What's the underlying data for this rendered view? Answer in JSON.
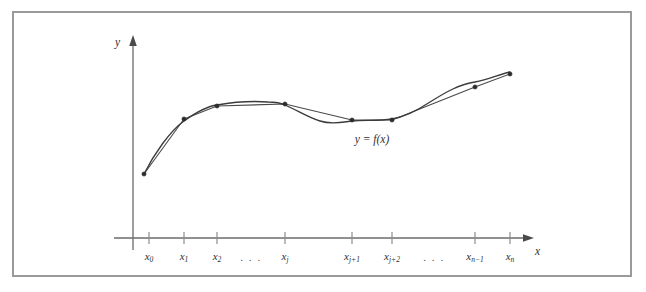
{
  "figure": {
    "frame_border_color": "#9a9a9a",
    "background_color": "#ffffff",
    "curve_color": "#3b3b3b",
    "chord_color": "#4a4a4a",
    "axis_color": "#6b6b6b",
    "point_color": "#2b2b2b"
  },
  "labels": {
    "y_axis": "y",
    "x_axis": "x",
    "curve_equation_y": "y",
    "curve_equation_eq": "=",
    "curve_equation_f": "f",
    "curve_equation_paren_open": "(",
    "curve_equation_var": "x",
    "curve_equation_paren_close": ")",
    "curve_equation_full": "y = f(x)",
    "ellipsis": ". . ."
  },
  "chart_data": {
    "type": "line",
    "title": "",
    "subtitle": "",
    "xlabel": "x",
    "ylabel": "y",
    "grid": false,
    "legend": null,
    "annotations": [
      {
        "text": "y = f(x)",
        "x_px": 370,
        "y_px": 128
      }
    ],
    "axis": {
      "y_axis_x_px": 131,
      "y_axis_top_px": 36,
      "y_axis_bottom_px": 248,
      "x_axis_y_px": 236,
      "x_axis_left_px": 112,
      "x_axis_right_px": 530,
      "arrow_x_px": 528,
      "arrow_y_px": 38
    },
    "tick_labels": [
      {
        "base": "x",
        "sub": "0",
        "x_px": 147
      },
      {
        "base": "x",
        "sub": "1",
        "x_px": 182
      },
      {
        "base": "x",
        "sub": "2",
        "x_px": 215
      },
      {
        "base": "x",
        "sub": "j",
        "x_px": 283
      },
      {
        "base": "x",
        "sub": "j+1",
        "x_px": 350
      },
      {
        "base": "x",
        "sub": "j+2",
        "x_px": 390
      },
      {
        "base": "x",
        "sub": "n−1",
        "x_px": 473
      },
      {
        "base": "x",
        "sub": "n",
        "x_px": 508
      }
    ],
    "ellipses_x_px": [
      249,
      432
    ],
    "points": [
      {
        "label": "x0",
        "x_px": 142,
        "y_px": 172
      },
      {
        "label": "x1",
        "x_px": 182,
        "y_px": 117
      },
      {
        "label": "x2",
        "x_px": 215,
        "y_px": 104
      },
      {
        "label": "xj",
        "x_px": 283,
        "y_px": 102
      },
      {
        "label": "xj+1",
        "x_px": 350,
        "y_px": 118
      },
      {
        "label": "xj+2",
        "x_px": 390,
        "y_px": 118
      },
      {
        "label": "xn-1",
        "x_px": 473,
        "y_px": 85
      },
      {
        "label": "xn",
        "x_px": 508,
        "y_px": 72
      }
    ],
    "curve_path": "M 142 172 C 152 152 168 129 182 119 C 196 109 206 104 215 103 C 232 100 252 99 266 100 C 274 100 279 101 283 103 C 295 108 305 115 318 119 C 330 123 341 120 350 119 C 364 118 377 119 390 117 C 404 115 416 108 428 100 C 444 90 458 82 473 80 C 486 78 498 72 508 70",
    "chord_path": "M 142 172 L 182 117 L 215 104 L 283 102 L 350 118 L 390 118 L 473 85 L 508 72"
  }
}
